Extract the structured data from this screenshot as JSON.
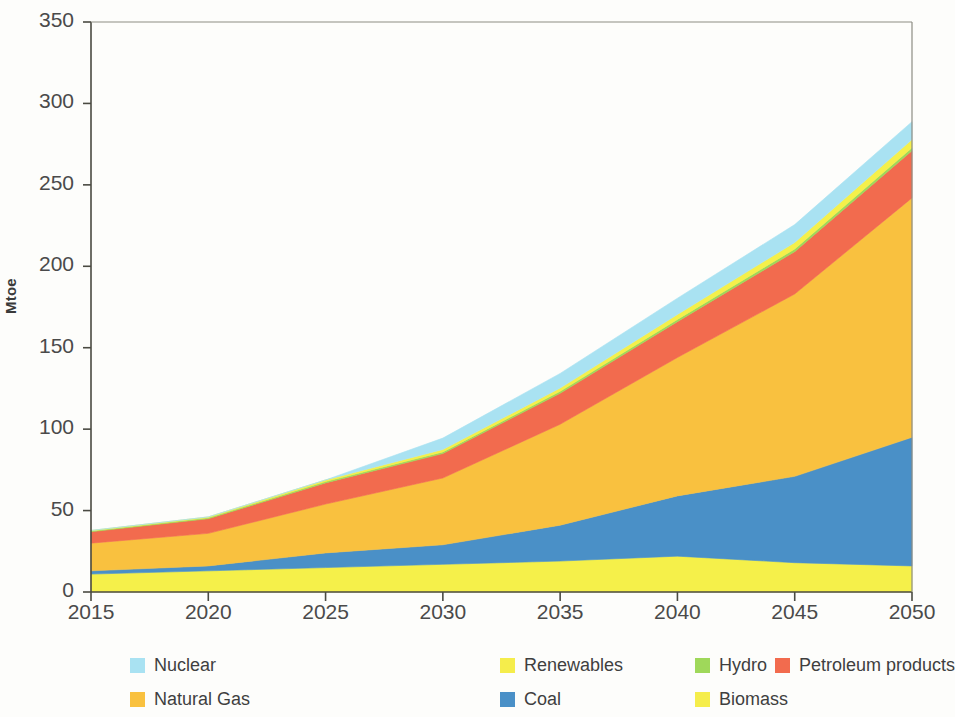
{
  "chart_data": {
    "type": "area",
    "stacked": true,
    "title": "",
    "subtitle": "",
    "xlabel": "",
    "ylabel": "Mtoe",
    "x": [
      2015,
      2020,
      2025,
      2030,
      2035,
      2040,
      2045,
      2050
    ],
    "xlim": [
      2015,
      2050
    ],
    "ylim": [
      0,
      350
    ],
    "xticks": [
      "2015",
      "2020",
      "2025",
      "2030",
      "2035",
      "2040",
      "2045",
      "2050"
    ],
    "yticks": [
      "0",
      "50",
      "100",
      "150",
      "200",
      "250",
      "300",
      "350"
    ],
    "grid": false,
    "legend_position": "bottom",
    "stack_order_bottom_to_top": [
      "Biomass",
      "Coal",
      "Natural Gas",
      "Petroleum products",
      "Hydro",
      "Renewables",
      "Nuclear"
    ],
    "series": [
      {
        "name": "Biomass",
        "color": "#f5f04a",
        "values": [
          11,
          13,
          15,
          17,
          19,
          22,
          18,
          16
        ]
      },
      {
        "name": "Coal",
        "color": "#4a90c7",
        "values": [
          2,
          3,
          9,
          12,
          22,
          37,
          53,
          79
        ]
      },
      {
        "name": "Natural Gas",
        "color": "#f9c13f",
        "values": [
          17,
          20,
          30,
          41,
          62,
          85,
          112,
          147
        ]
      },
      {
        "name": "Petroleum products",
        "color": "#f26b4e",
        "values": [
          7,
          9,
          13,
          15,
          19,
          22,
          26,
          29
        ]
      },
      {
        "name": "Hydro",
        "color": "#9fd85a",
        "values": [
          0.5,
          0.6,
          0.8,
          1,
          1.2,
          1.4,
          1.6,
          1.8
        ]
      },
      {
        "name": "Renewables",
        "color": "#f5f04a",
        "values": [
          0.3,
          0.5,
          1,
          1.5,
          2,
          3,
          4,
          5
        ]
      },
      {
        "name": "Nuclear",
        "color": "#a9e2f2",
        "values": [
          0,
          0,
          0,
          7,
          9,
          10,
          11,
          11
        ]
      }
    ],
    "totals": [
      38,
      46,
      69,
      95,
      134,
      180,
      226,
      289
    ]
  },
  "legend": {
    "rows": [
      [
        {
          "label": "Nuclear",
          "color": "#a9e2f2"
        },
        {
          "label": "Renewables",
          "color": "#f5ed4b"
        },
        {
          "label": "Hydro",
          "color": "#9fd85a"
        },
        {
          "label": "Petroleum products",
          "color": "#f26b4e"
        }
      ],
      [
        {
          "label": "Natural Gas",
          "color": "#f9c13f"
        },
        {
          "label": "Coal",
          "color": "#4a90c7"
        },
        {
          "label": "Biomass",
          "color": "#f5ed4b"
        }
      ]
    ]
  },
  "axis": {
    "y_title": "Mtoe"
  }
}
